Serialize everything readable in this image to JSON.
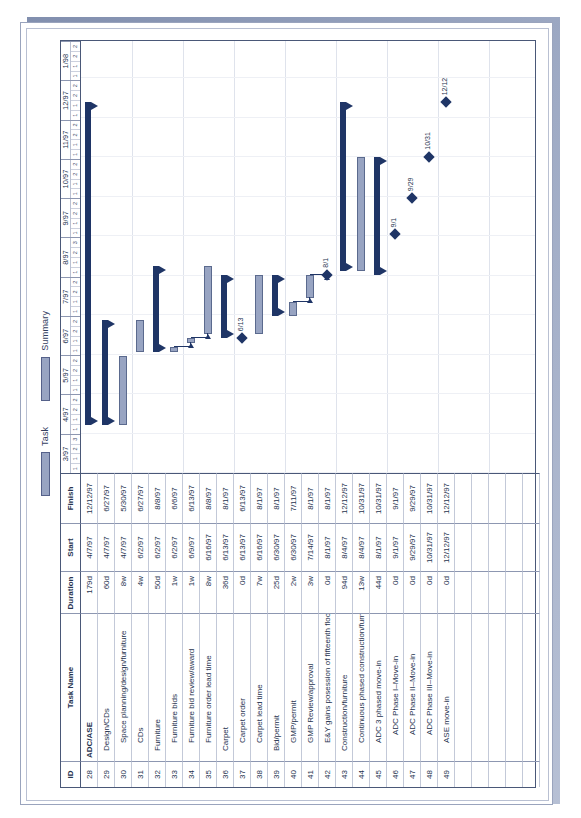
{
  "legend": {
    "task_label": "Task",
    "summary_label": "Summary"
  },
  "table": {
    "headers": {
      "id": "ID",
      "name": "Task Name",
      "duration": "Duration",
      "start": "Start",
      "finish": "Finish"
    },
    "rows": [
      {
        "id": "28",
        "name": "ADC/ASE",
        "level": 1,
        "duration": "179d",
        "start": "4/7/97",
        "finish": "12/12/97"
      },
      {
        "id": "29",
        "name": "Design/CDs",
        "level": 2,
        "duration": "60d",
        "start": "4/7/97",
        "finish": "6/27/97"
      },
      {
        "id": "30",
        "name": "Space planning/design/furniture",
        "level": 3,
        "duration": "8w",
        "start": "4/7/97",
        "finish": "5/30/97"
      },
      {
        "id": "31",
        "name": "CDs",
        "level": 3,
        "duration": "4w",
        "start": "6/2/97",
        "finish": "6/27/97"
      },
      {
        "id": "32",
        "name": "Furniture",
        "level": 2,
        "duration": "50d",
        "start": "6/2/97",
        "finish": "8/8/97"
      },
      {
        "id": "33",
        "name": "Furniture bids",
        "level": 3,
        "duration": "1w",
        "start": "6/2/97",
        "finish": "6/6/97"
      },
      {
        "id": "34",
        "name": "Furniture bid review/award",
        "level": 3,
        "duration": "1w",
        "start": "6/9/97",
        "finish": "6/13/97"
      },
      {
        "id": "35",
        "name": "Furniture order lead time",
        "level": 3,
        "duration": "8w",
        "start": "6/16/97",
        "finish": "8/8/97"
      },
      {
        "id": "36",
        "name": "Carpet",
        "level": 2,
        "duration": "36d",
        "start": "6/13/97",
        "finish": "8/1/97"
      },
      {
        "id": "37",
        "name": "Carpet order",
        "level": 3,
        "duration": "0d",
        "start": "6/13/97",
        "finish": "6/13/97"
      },
      {
        "id": "38",
        "name": "Carpet lead time",
        "level": 3,
        "duration": "7w",
        "start": "6/16/97",
        "finish": "8/1/97"
      },
      {
        "id": "39",
        "name": "Bid/permit",
        "level": 2,
        "duration": "25d",
        "start": "6/30/97",
        "finish": "8/1/97"
      },
      {
        "id": "40",
        "name": "GMP/permit",
        "level": 3,
        "duration": "2w",
        "start": "6/30/97",
        "finish": "7/11/97"
      },
      {
        "id": "41",
        "name": "GMP Review/approval",
        "level": 3,
        "duration": "3w",
        "start": "7/14/97",
        "finish": "8/1/97"
      },
      {
        "id": "42",
        "name": "E&Y gains posession of fifteenth floor",
        "level": 3,
        "duration": "0d",
        "start": "8/1/97",
        "finish": "8/1/97"
      },
      {
        "id": "43",
        "name": "Construction/furniture",
        "level": 2,
        "duration": "94d",
        "start": "8/4/97",
        "finish": "12/12/97"
      },
      {
        "id": "44",
        "name": "Continuous phased construction/furniture",
        "level": 3,
        "duration": "13w",
        "start": "8/4/97",
        "finish": "10/31/97"
      },
      {
        "id": "45",
        "name": "ADC 3 phased move-in",
        "level": 3,
        "duration": "44d",
        "start": "8/1/97",
        "finish": "10/31/97"
      },
      {
        "id": "46",
        "name": "ADC Phase I–Move-in",
        "level": 4,
        "duration": "0d",
        "start": "9/1/97",
        "finish": "9/1/97"
      },
      {
        "id": "47",
        "name": "ADC Phase II–Move-in",
        "level": 4,
        "duration": "0d",
        "start": "9/29/97",
        "finish": "9/29/97"
      },
      {
        "id": "48",
        "name": "ADC Phase III–Move-in",
        "level": 4,
        "duration": "0d",
        "start": "10/31/97",
        "finish": "10/31/97"
      },
      {
        "id": "49",
        "name": "ASE move-in",
        "level": 3,
        "duration": "0d",
        "start": "12/12/97",
        "finish": "12/12/97"
      },
      {
        "id": "50",
        "name": "",
        "level": 1,
        "duration": "",
        "start": "",
        "finish": ""
      },
      {
        "id": "51",
        "name": "",
        "level": 1,
        "duration": "",
        "start": "",
        "finish": ""
      },
      {
        "id": "52",
        "name": "",
        "level": 1,
        "duration": "",
        "start": "",
        "finish": ""
      },
      {
        "id": "53",
        "name": "",
        "level": 1,
        "duration": "",
        "start": "",
        "finish": ""
      },
      {
        "id": "54",
        "name": "",
        "level": 1,
        "duration": "",
        "start": "",
        "finish": ""
      }
    ]
  },
  "chart_data": {
    "type": "bar",
    "xlabel": "",
    "ylabel": "",
    "grid": true,
    "legend_position": "top",
    "timeline_months": [
      "3/97",
      "4/97",
      "5/97",
      "6/97",
      "7/97",
      "8/97",
      "9/97",
      "10/97",
      "11/97",
      "12/97",
      "1/98"
    ],
    "timeline_week_ticks": [
      [
        "1",
        "1",
        "2",
        "3"
      ],
      [
        "1",
        "1",
        "2",
        "2"
      ],
      [
        "1",
        "1",
        "2",
        "2"
      ],
      [
        "1",
        "1",
        "2",
        "2"
      ],
      [
        "1",
        "1",
        "2",
        "2"
      ],
      [
        "1",
        "1",
        "2",
        "3"
      ],
      [
        "1",
        "1",
        "2",
        "2"
      ],
      [
        "1",
        "1",
        "2",
        "2"
      ],
      [
        "1",
        "1",
        "2",
        "2"
      ],
      [
        "1",
        "1",
        "2",
        "2"
      ],
      [
        "1",
        "1",
        "2",
        "2"
      ]
    ],
    "categories": [
      "ADC/ASE",
      "Design/CDs",
      "Space planning/design/furniture",
      "CDs",
      "Furniture",
      "Furniture bids",
      "Furniture bid review/award",
      "Furniture order lead time",
      "Carpet",
      "Carpet order",
      "Carpet lead time",
      "Bid/permit",
      "GMP/permit",
      "GMP Review/approval",
      "E&Y gains posession of fifteenth floor",
      "Construction/furniture",
      "Continuous phased construction/furniture",
      "ADC 3 phased move-in",
      "ADC Phase I–Move-in",
      "ADC Phase II–Move-in",
      "ADC Phase III–Move-in",
      "ASE move-in"
    ],
    "bars": [
      {
        "row": 0,
        "kind": "summary",
        "start": "4/7/97",
        "finish": "12/12/97",
        "label": ""
      },
      {
        "row": 1,
        "kind": "summary",
        "start": "4/7/97",
        "finish": "6/27/97",
        "label": ""
      },
      {
        "row": 2,
        "kind": "task",
        "start": "4/7/97",
        "finish": "5/30/97",
        "label": ""
      },
      {
        "row": 3,
        "kind": "task",
        "start": "6/2/97",
        "finish": "6/27/97",
        "label": ""
      },
      {
        "row": 4,
        "kind": "summary",
        "start": "6/2/97",
        "finish": "8/8/97",
        "label": ""
      },
      {
        "row": 5,
        "kind": "task",
        "start": "6/2/97",
        "finish": "6/6/97",
        "label": ""
      },
      {
        "row": 6,
        "kind": "task",
        "start": "6/9/97",
        "finish": "6/13/97",
        "label": ""
      },
      {
        "row": 7,
        "kind": "task",
        "start": "6/16/97",
        "finish": "8/8/97",
        "label": ""
      },
      {
        "row": 8,
        "kind": "summary",
        "start": "6/13/97",
        "finish": "8/1/97",
        "label": ""
      },
      {
        "row": 9,
        "kind": "milestone",
        "start": "6/13/97",
        "finish": "6/13/97",
        "label": "6/13"
      },
      {
        "row": 10,
        "kind": "task",
        "start": "6/16/97",
        "finish": "8/1/97",
        "label": ""
      },
      {
        "row": 11,
        "kind": "summary",
        "start": "6/30/97",
        "finish": "8/1/97",
        "label": ""
      },
      {
        "row": 12,
        "kind": "task",
        "start": "6/30/97",
        "finish": "7/11/97",
        "label": ""
      },
      {
        "row": 13,
        "kind": "task",
        "start": "7/14/97",
        "finish": "8/1/97",
        "label": ""
      },
      {
        "row": 14,
        "kind": "milestone",
        "start": "8/1/97",
        "finish": "8/1/97",
        "label": "8/1"
      },
      {
        "row": 15,
        "kind": "summary",
        "start": "8/4/97",
        "finish": "12/12/97",
        "label": ""
      },
      {
        "row": 16,
        "kind": "task",
        "start": "8/4/97",
        "finish": "10/31/97",
        "label": ""
      },
      {
        "row": 17,
        "kind": "summary",
        "start": "8/1/97",
        "finish": "10/31/97",
        "label": ""
      },
      {
        "row": 18,
        "kind": "milestone",
        "start": "9/1/97",
        "finish": "9/1/97",
        "label": "9/1"
      },
      {
        "row": 19,
        "kind": "milestone",
        "start": "9/29/97",
        "finish": "9/29/97",
        "label": "9/29"
      },
      {
        "row": 20,
        "kind": "milestone",
        "start": "10/31/97",
        "finish": "10/31/97",
        "label": "10/31"
      },
      {
        "row": 21,
        "kind": "milestone",
        "start": "12/12/97",
        "finish": "12/12/97",
        "label": "12/12"
      }
    ]
  },
  "colors": {
    "task_bar_fill": "#98a4c2",
    "task_bar_border": "#5b6a8e",
    "summary_bar": "#1f3566",
    "milestone": "#1f3566",
    "grid": "#dfe3ec",
    "table_border": "#4a5878",
    "text": "#26334f"
  }
}
